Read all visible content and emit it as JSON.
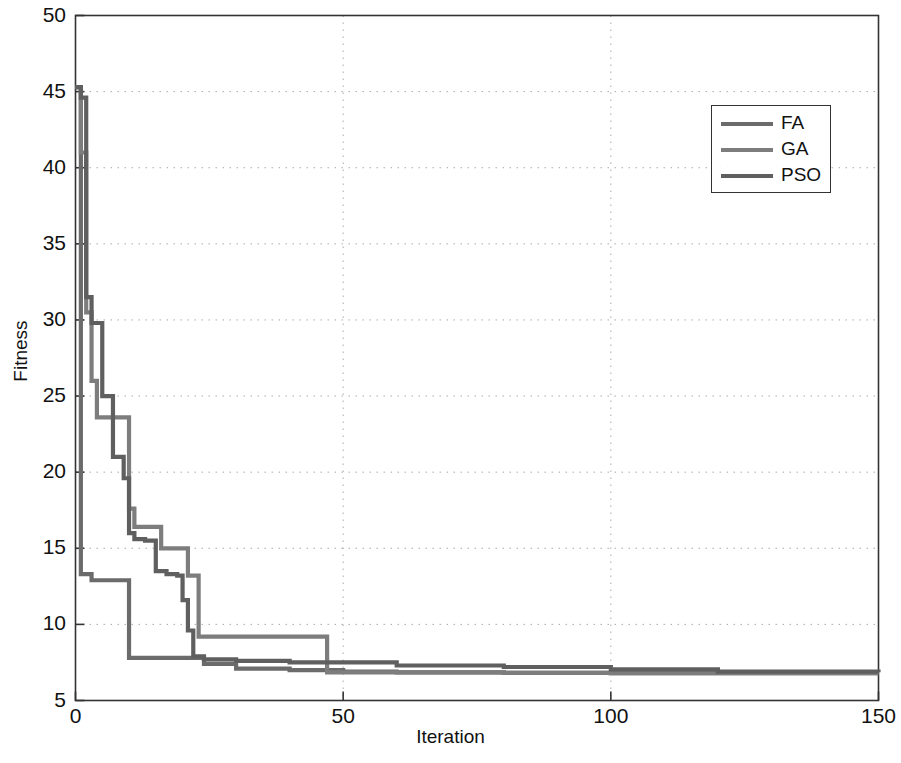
{
  "chart_data": {
    "type": "line",
    "title": "",
    "xlabel": "Iteration",
    "ylabel": "Fitness",
    "xlim": [
      0,
      150
    ],
    "ylim": [
      5,
      50
    ],
    "xticks": [
      0,
      50,
      100,
      150
    ],
    "yticks": [
      5,
      10,
      15,
      20,
      25,
      30,
      35,
      40,
      45,
      50
    ],
    "grid": true,
    "grid_style": "dotted",
    "legend_position": "upper right",
    "series": [
      {
        "name": "FA",
        "color": "#6b6b6b",
        "x": [
          0,
          1,
          2,
          3,
          4,
          6,
          8,
          10,
          12,
          14,
          16,
          18,
          20,
          24,
          30,
          40,
          50,
          60,
          80,
          100,
          120,
          150
        ],
        "values": [
          45.3,
          13.3,
          13.3,
          12.9,
          12.9,
          12.9,
          12.9,
          7.8,
          7.8,
          7.8,
          7.8,
          7.8,
          7.8,
          7.4,
          7.1,
          7.0,
          6.9,
          6.85,
          6.82,
          6.8,
          6.8,
          6.8
        ]
      },
      {
        "name": "GA",
        "color": "#7d7d7d",
        "x": [
          0,
          1,
          2,
          3,
          4,
          5,
          7,
          9,
          10,
          11,
          13,
          16,
          19,
          21,
          23,
          26,
          30,
          40,
          46,
          47,
          60,
          80,
          100,
          120,
          150
        ],
        "values": [
          45.3,
          41.0,
          30.5,
          26.0,
          23.6,
          23.6,
          23.6,
          23.6,
          17.6,
          16.4,
          16.4,
          15.0,
          15.0,
          13.2,
          9.2,
          9.2,
          9.2,
          9.2,
          9.2,
          6.85,
          6.85,
          6.82,
          6.8,
          6.8,
          6.8
        ]
      },
      {
        "name": "PSO",
        "color": "#5f5f5f",
        "x": [
          0,
          1,
          2,
          3,
          5,
          7,
          9,
          10,
          11,
          13,
          15,
          17,
          19,
          20,
          21,
          22,
          24,
          30,
          40,
          60,
          80,
          100,
          120,
          150
        ],
        "values": [
          45.3,
          44.6,
          31.5,
          29.8,
          25.0,
          21.0,
          19.6,
          16.0,
          15.6,
          15.5,
          13.5,
          13.3,
          13.2,
          11.6,
          9.6,
          7.9,
          7.7,
          7.6,
          7.5,
          7.3,
          7.2,
          7.05,
          6.9,
          6.85
        ]
      }
    ]
  },
  "legend": {
    "entries": [
      {
        "label": "FA"
      },
      {
        "label": "GA"
      },
      {
        "label": "PSO"
      }
    ]
  },
  "axes": {
    "xlabel": "Iteration",
    "ylabel": "Fitness",
    "xtick_labels": [
      "0",
      "50",
      "100",
      "150"
    ],
    "ytick_labels": [
      "5",
      "10",
      "15",
      "20",
      "25",
      "30",
      "35",
      "40",
      "45",
      "50"
    ]
  },
  "style": {
    "axis_color": "#333333",
    "grid_color": "#aaaaaa",
    "background": "#ffffff"
  }
}
